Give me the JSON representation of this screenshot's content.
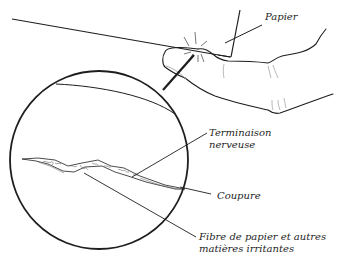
{
  "diagram": {
    "type": "illustration",
    "labels": {
      "papier": "Papier",
      "terminaison_line1": "Terminaison",
      "terminaison_line2": "nerveuse",
      "coupure": "Coupure",
      "fibre_line1": "Fibre de papier et autres",
      "fibre_line2": "matières irritantes"
    },
    "colors": {
      "line": "#1e1e1e",
      "background": "#ffffff",
      "light_line": "#8a8a8a"
    }
  }
}
